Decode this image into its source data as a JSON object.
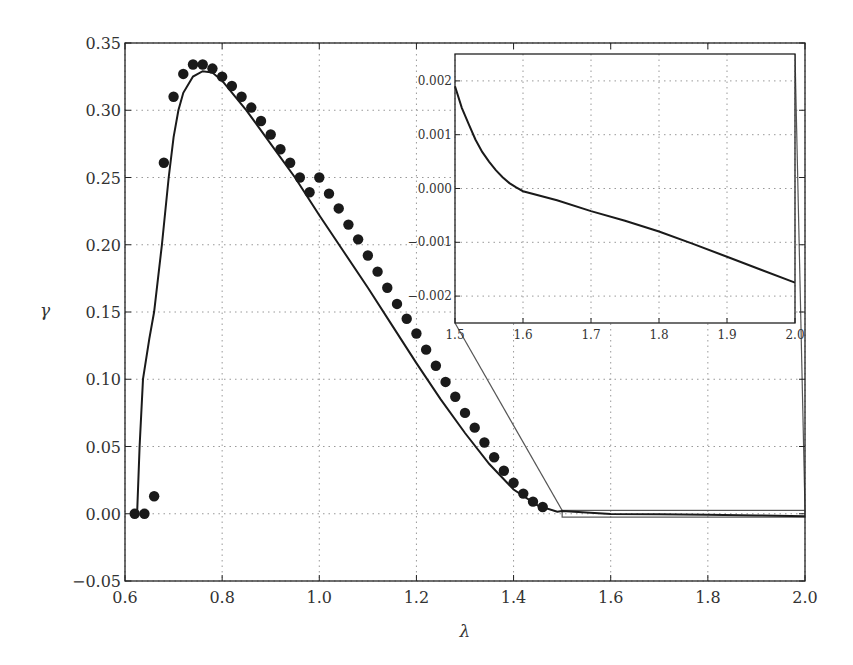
{
  "chart_data": {
    "type": "line",
    "title": "",
    "xlabel": "λ",
    "ylabel": "γ",
    "xlim": [
      0.6,
      2.0
    ],
    "ylim": [
      -0.05,
      0.35
    ],
    "grid": true,
    "legend": null,
    "xticks": [
      "0.6",
      "0.8",
      "1.0",
      "1.2",
      "1.4",
      "1.6",
      "1.8",
      "2.0"
    ],
    "yticks": [
      "−0.05",
      "0.00",
      "0.05",
      "0.10",
      "0.15",
      "0.20",
      "0.25",
      "0.30",
      "0.35"
    ],
    "series": [
      {
        "name": "points",
        "kind": "scatter",
        "marker": "filled-circle",
        "x": [
          0.62,
          0.64,
          0.66,
          0.68,
          0.7,
          0.72,
          0.74,
          0.76,
          0.78,
          0.8,
          0.82,
          0.84,
          0.86,
          0.88,
          0.9,
          0.92,
          0.94,
          0.96,
          0.98,
          1.0,
          1.02,
          1.04,
          1.06,
          1.08,
          1.1,
          1.12,
          1.14,
          1.16,
          1.18,
          1.2,
          1.22,
          1.24,
          1.26,
          1.28,
          1.3,
          1.32,
          1.34,
          1.36,
          1.38,
          1.4,
          1.42,
          1.44,
          1.46
        ],
        "y": [
          0.0,
          0.0,
          0.013,
          0.261,
          0.31,
          0.327,
          0.334,
          0.334,
          0.331,
          0.325,
          0.318,
          0.31,
          0.302,
          0.292,
          0.282,
          0.271,
          0.261,
          0.25,
          0.239,
          0.25,
          0.238,
          0.227,
          0.215,
          0.204,
          0.192,
          0.18,
          0.168,
          0.156,
          0.145,
          0.134,
          0.122,
          0.11,
          0.098,
          0.087,
          0.075,
          0.064,
          0.053,
          0.042,
          0.032,
          0.023,
          0.015,
          0.009,
          0.005
        ]
      },
      {
        "name": "curve",
        "kind": "line",
        "x": [
          0.625,
          0.63,
          0.637,
          0.65,
          0.66,
          0.676,
          0.69,
          0.7,
          0.71,
          0.72,
          0.74,
          0.76,
          0.78,
          0.8,
          0.85,
          0.9,
          0.95,
          1.0,
          1.05,
          1.1,
          1.15,
          1.2,
          1.25,
          1.3,
          1.35,
          1.4,
          1.45,
          1.49,
          1.5,
          1.6,
          1.7,
          1.8,
          1.9,
          2.0
        ],
        "y": [
          0.0,
          0.05,
          0.1,
          0.13,
          0.15,
          0.2,
          0.25,
          0.28,
          0.3,
          0.313,
          0.325,
          0.329,
          0.328,
          0.322,
          0.3,
          0.275,
          0.25,
          0.222,
          0.195,
          0.168,
          0.14,
          0.112,
          0.085,
          0.06,
          0.037,
          0.018,
          0.006,
          0.0015,
          0.002,
          -0.0001,
          -0.0004,
          -0.0008,
          -0.0013,
          -0.0018
        ]
      }
    ],
    "inset": {
      "xlim": [
        1.5,
        2.0
      ],
      "ylim": [
        -0.0025,
        0.0025
      ],
      "xticks": [
        "1.5",
        "1.6",
        "1.7",
        "1.8",
        "1.9",
        "2.0"
      ],
      "yticks": [
        "−0.002",
        "−0.001",
        "0.000",
        "0.001",
        "0.002"
      ],
      "grid": true,
      "series": [
        {
          "name": "curve-zoom",
          "kind": "line",
          "x": [
            1.5,
            1.51,
            1.52,
            1.53,
            1.54,
            1.55,
            1.56,
            1.57,
            1.58,
            1.59,
            1.6,
            1.65,
            1.7,
            1.75,
            1.8,
            1.85,
            1.9,
            1.95,
            2.0
          ],
          "y": [
            0.0019,
            0.0015,
            0.0012,
            0.00091,
            0.00068,
            0.0005,
            0.00034,
            0.00021,
            0.0001,
            2e-05,
            -5e-05,
            -0.00022,
            -0.00042,
            -0.0006,
            -0.0008,
            -0.00103,
            -0.00127,
            -0.00151,
            -0.00175
          ]
        }
      ],
      "zoom_region": {
        "x": [
          1.5,
          2.0
        ],
        "y": [
          -0.0025,
          0.0025
        ]
      }
    }
  }
}
